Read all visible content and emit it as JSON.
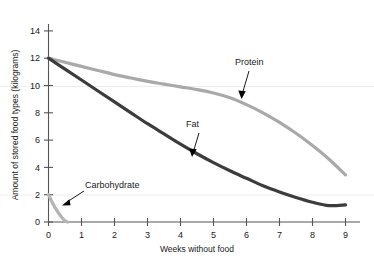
{
  "chart_data": {
    "type": "line",
    "title": "",
    "xlabel": "Weeks without food",
    "ylabel": "Amount of stored food types (kilograms)",
    "xlim": [
      0,
      9.3
    ],
    "ylim": [
      0,
      14.6
    ],
    "xticks": [
      "0",
      "1",
      "2",
      "3",
      "4",
      "5",
      "6",
      "7",
      "8",
      "9"
    ],
    "yticks": [
      "0",
      "2",
      "4",
      "6",
      "8",
      "10",
      "12",
      "14"
    ],
    "grid": "horizontal-faint at y=2 and y=10",
    "legend": "inline annotations with arrows",
    "series": [
      {
        "name": "Protein",
        "color": "#a9a9a9",
        "label_x": 6.0,
        "label_y": 11.8,
        "x": [
          0,
          0.5,
          1,
          1.5,
          2,
          2.5,
          3,
          3.5,
          4,
          4.5,
          5,
          5.5,
          6,
          6.5,
          7,
          7.5,
          8,
          8.5,
          9
        ],
        "y": [
          12.0,
          11.7,
          11.4,
          11.1,
          10.8,
          10.55,
          10.3,
          10.1,
          9.9,
          9.7,
          9.45,
          9.1,
          8.6,
          8.0,
          7.3,
          6.5,
          5.6,
          4.6,
          3.45
        ]
      },
      {
        "name": "Fat",
        "color": "#3c3c3c",
        "label_x": 4.3,
        "label_y": 6.6,
        "x": [
          0,
          0.5,
          1,
          1.5,
          2,
          2.5,
          3,
          3.5,
          4,
          4.5,
          5,
          5.5,
          6,
          6.5,
          7,
          7.5,
          8,
          8.5,
          9
        ],
        "y": [
          12.0,
          11.2,
          10.4,
          9.6,
          8.8,
          8.0,
          7.2,
          6.45,
          5.7,
          5.0,
          4.35,
          3.75,
          3.2,
          2.65,
          2.2,
          1.8,
          1.45,
          1.2,
          1.25
        ]
      },
      {
        "name": "Carbohydrate",
        "color": "#b4b4b4",
        "label_x": 1.1,
        "label_y": 2.65,
        "x": [
          0,
          0.1,
          0.2,
          0.3,
          0.4,
          0.5,
          0.58
        ],
        "y": [
          2.0,
          1.5,
          1.05,
          0.68,
          0.35,
          0.1,
          0.0
        ]
      }
    ]
  },
  "annotations": [
    {
      "name": "protein-annotation",
      "text": "Protein"
    },
    {
      "name": "fat-annotation",
      "text": "Fat"
    },
    {
      "name": "carbohydrate-annotation",
      "text": "Carbohydrate"
    }
  ],
  "axes": {
    "x_title": "Weeks without food",
    "y_title": "Amount of stored food types (kilograms)",
    "x_tick_labels": [
      "0",
      "1",
      "2",
      "3",
      "4",
      "5",
      "6",
      "7",
      "8",
      "9"
    ],
    "y_tick_labels": [
      "0",
      "2",
      "4",
      "6",
      "8",
      "10",
      "12",
      "14"
    ]
  },
  "colors": {
    "protein": "#a9a9a9",
    "fat": "#3c3c3c",
    "carbohydrate": "#b4b4b4",
    "axis": "#555555",
    "grid": "#ededed",
    "background": "#ffffff",
    "text": "#1a1a1a"
  }
}
